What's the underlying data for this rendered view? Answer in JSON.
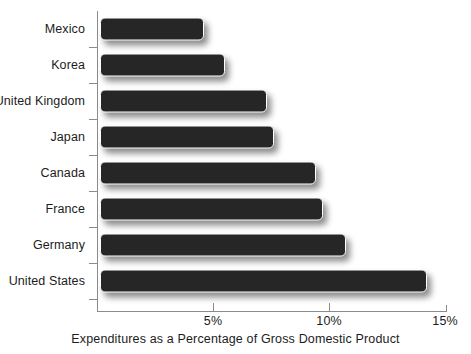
{
  "chart_data": {
    "type": "bar",
    "orientation": "horizontal",
    "title": "",
    "xlabel": "Expenditures as a Percentage of Gross Domestic Product",
    "ylabel": "",
    "categories": [
      "Mexico",
      "Korea",
      "United Kingdom",
      "Japan",
      "Canada",
      "France",
      "Germany",
      "United States"
    ],
    "values": [
      4.5,
      5.4,
      7.2,
      7.5,
      9.3,
      9.6,
      10.6,
      14.1
    ],
    "xlim": [
      0,
      15
    ],
    "xticks": [
      5,
      10,
      15
    ],
    "xtick_labels": [
      "5%",
      "10%",
      "15%"
    ],
    "grid": false,
    "legend": null,
    "series": [
      {
        "name": "Expenditures as a Percentage of Gross Domestic Product",
        "values": [
          4.5,
          5.4,
          7.2,
          7.5,
          9.3,
          9.6,
          10.6,
          14.1
        ]
      }
    ],
    "bar_color": "#262626",
    "axis_color": "#8c8c8c",
    "text_color": "#1c1c1c",
    "background_color": "#ffffff"
  },
  "axis": {
    "x_title": "Expenditures as a Percentage of Gross Domestic Product",
    "ticks": [
      {
        "label": "5%",
        "value": 5
      },
      {
        "label": "10%",
        "value": 10
      },
      {
        "label": "15%",
        "value": 15
      }
    ]
  },
  "rows": [
    {
      "label": "Mexico",
      "value": 4.5
    },
    {
      "label": "Korea",
      "value": 5.4
    },
    {
      "label": "United Kingdom",
      "value": 7.2
    },
    {
      "label": "Japan",
      "value": 7.5
    },
    {
      "label": "Canada",
      "value": 9.3
    },
    {
      "label": "France",
      "value": 9.6
    },
    {
      "label": "Germany",
      "value": 10.6
    },
    {
      "label": "United States",
      "value": 14.1
    }
  ]
}
